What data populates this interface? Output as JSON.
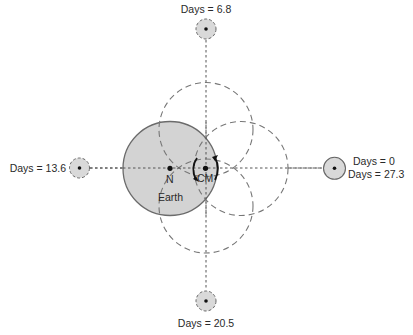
{
  "diagram": {
    "colors": {
      "earth_fill": "#d3d3d3",
      "earth_stroke": "#6b6b6b",
      "moon_fill": "#d9d9d9",
      "dashed": "#777777",
      "axis": "#555555",
      "dot": "#111111",
      "text": "#2a2a2a"
    },
    "labels": {
      "earth": "Earth",
      "north_pole": "N",
      "center_of_mass": "CM"
    },
    "moon_positions": [
      {
        "id": "top",
        "label": "Days = 6.8"
      },
      {
        "id": "left",
        "label": "Days = 13.6"
      },
      {
        "id": "bottom",
        "label": "Days = 20.5"
      },
      {
        "id": "right",
        "label_line1": "Days = 0",
        "label_line2": "Days = 27.3"
      }
    ]
  }
}
